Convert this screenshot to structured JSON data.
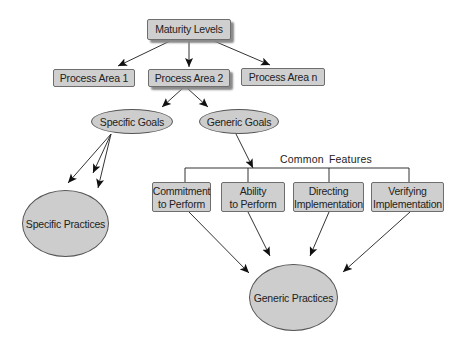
{
  "diagram": {
    "root": {
      "label": "Maturity Levels"
    },
    "process_areas": [
      {
        "label": "Process Area 1"
      },
      {
        "label": "Process Area 2"
      },
      {
        "label": "Process Area n"
      }
    ],
    "goals": {
      "specific": {
        "label": "Specific Goals"
      },
      "generic": {
        "label": "Generic Goals"
      }
    },
    "common_features": {
      "label": "Common Features",
      "items": [
        {
          "line1": "Commitment",
          "line2": "to Perform"
        },
        {
          "line1": "Ability",
          "line2": "to Perform"
        },
        {
          "line1": "Directing",
          "line2": "Implementation"
        },
        {
          "line1": "Verifying",
          "line2": "Implementation"
        }
      ]
    },
    "practices": {
      "specific": {
        "label": "Specific Practices"
      },
      "generic": {
        "label": "Generic Practices"
      }
    },
    "colors": {
      "node_fill": "#cfcfcf",
      "node_border": "#6e6e6e",
      "line": "#333333",
      "shadow": "#8a8a8a"
    }
  }
}
